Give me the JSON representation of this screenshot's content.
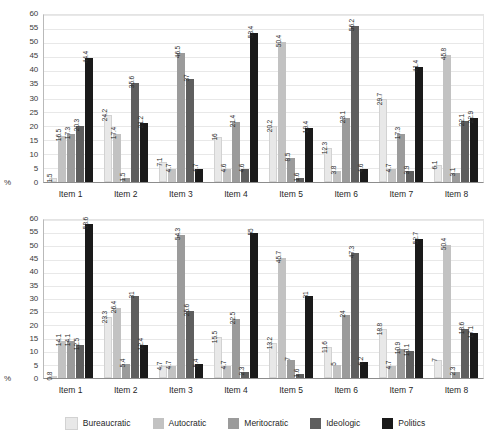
{
  "chart_data": [
    {
      "type": "bar",
      "title": "",
      "xlabel": "",
      "ylabel": "%",
      "ylim": [
        0,
        60
      ],
      "yticks": [
        0,
        5,
        10,
        15,
        20,
        25,
        30,
        35,
        40,
        45,
        50,
        55,
        60
      ],
      "grid": true,
      "legend_position": "bottom",
      "categories": [
        "Item 1",
        "Item 2",
        "Item 3",
        "Item 4",
        "Item 5",
        "Item 6",
        "Item 7",
        "Item 8"
      ],
      "series": [
        {
          "name": "Bureaucratic",
          "color": "#e8e8e8",
          "values": [
            1.5,
            24.2,
            7.1,
            16,
            20.2,
            12.3,
            29.7,
            6.1
          ]
        },
        {
          "name": "Autocratic",
          "color": "#c2c2c2",
          "values": [
            16.5,
            17.4,
            4.7,
            4.6,
            50.4,
            3.8,
            4.7,
            45.8
          ]
        },
        {
          "name": "Meritocratic",
          "color": "#9b9b9b",
          "values": [
            17.3,
            1.5,
            46.5,
            21.4,
            8.5,
            23.1,
            17.3,
            3.1
          ]
        },
        {
          "name": "Ideologic",
          "color": "#5e5e5e",
          "values": [
            20.3,
            35.6,
            37,
            4.6,
            1.6,
            56.2,
            3.9,
            22.1
          ]
        },
        {
          "name": "Politics",
          "color": "#1a1a1a",
          "values": [
            44.4,
            21.2,
            4.7,
            53.4,
            19.4,
            4.6,
            41.4,
            22.9
          ]
        }
      ]
    },
    {
      "type": "bar",
      "title": "",
      "xlabel": "",
      "ylabel": "%",
      "ylim": [
        0,
        60
      ],
      "yticks": [
        0,
        5,
        10,
        15,
        20,
        25,
        30,
        35,
        40,
        45,
        50,
        55,
        60
      ],
      "grid": true,
      "legend_position": "bottom",
      "categories": [
        "Item 1",
        "Item 2",
        "Item 3",
        "Item 4",
        "Item 5",
        "Item 6",
        "Item 7",
        "Item 8"
      ],
      "series": [
        {
          "name": "Bureaucratic",
          "color": "#e8e8e8",
          "values": [
            0.8,
            23.3,
            4.7,
            15.5,
            13.2,
            11.6,
            18.8,
            7
          ]
        },
        {
          "name": "Autocratic",
          "color": "#c2c2c2",
          "values": [
            14.1,
            26.4,
            4.7,
            4.7,
            45.7,
            5,
            4.7,
            50.4
          ]
        },
        {
          "name": "Meritocratic",
          "color": "#9b9b9b",
          "values": [
            14.1,
            5.4,
            54.3,
            22.5,
            7,
            24,
            10.9,
            2.3
          ]
        },
        {
          "name": "Ideologic",
          "color": "#5e5e5e",
          "values": [
            12.5,
            31,
            25.6,
            2.3,
            1.6,
            47.3,
            10.1,
            18.6
          ]
        },
        {
          "name": "Politics",
          "color": "#1a1a1a",
          "values": [
            58.6,
            12.4,
            5.4,
            55,
            31,
            6.2,
            52.7,
            17.1
          ]
        }
      ]
    }
  ],
  "legend": {
    "items": [
      {
        "label": "Bureaucratic",
        "color": "#e8e8e8"
      },
      {
        "label": "Autocratic",
        "color": "#c2c2c2"
      },
      {
        "label": "Meritocratic",
        "color": "#9b9b9b"
      },
      {
        "label": "Ideologic",
        "color": "#5e5e5e"
      },
      {
        "label": "Politics",
        "color": "#1a1a1a"
      }
    ]
  }
}
